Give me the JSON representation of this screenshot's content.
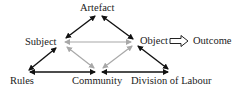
{
  "diagram": {
    "type": "activity-system-triangle",
    "nodes": {
      "artefact": "Artefact",
      "subject": "Subject",
      "object": "Object",
      "outcome": "Outcome",
      "rules": "Rules",
      "community": "Community",
      "division_of_labour": "Division of Labour"
    },
    "edges": [
      {
        "from": "Subject",
        "to": "Artefact",
        "style": "black",
        "direction": "both"
      },
      {
        "from": "Artefact",
        "to": "Object",
        "style": "black",
        "direction": "both"
      },
      {
        "from": "Subject",
        "to": "Rules",
        "style": "black",
        "direction": "both"
      },
      {
        "from": "Rules",
        "to": "Community",
        "style": "black",
        "direction": "both"
      },
      {
        "from": "Community",
        "to": "Division of Labour",
        "style": "black",
        "direction": "both"
      },
      {
        "from": "Division of Labour",
        "to": "Object",
        "style": "black",
        "direction": "both"
      },
      {
        "from": "Subject",
        "to": "Object",
        "style": "gray",
        "direction": "both"
      },
      {
        "from": "Subject",
        "to": "Community",
        "style": "gray",
        "direction": "both"
      },
      {
        "from": "Object",
        "to": "Community",
        "style": "gray",
        "direction": "both"
      },
      {
        "from": "Object",
        "to": "Outcome",
        "style": "hollow-arrow",
        "direction": "forward"
      }
    ],
    "colors": {
      "black_edge": "#111111",
      "gray_edge": "#a8a8a8",
      "text": "#222222"
    }
  }
}
